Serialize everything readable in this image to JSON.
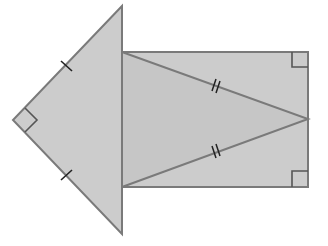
{
  "diagram": {
    "colors": {
      "fill": "#cccccc",
      "fill_inner": "#c6c6c6",
      "stroke": "#7a7a7a",
      "mark": "#222222",
      "background": "#ffffff"
    },
    "shapes": {
      "left_triangle": {
        "type": "right-isosceles-triangle",
        "vertices": [
          [
            122,
            6
          ],
          [
            13,
            120
          ],
          [
            122,
            234
          ]
        ],
        "right_angle_at": "left-apex",
        "equal_sides_mark": "single-tick"
      },
      "rectangle": {
        "type": "rectangle",
        "x": 122,
        "y": 52,
        "width": 186,
        "height": 135,
        "right_angles_marked": [
          "top-right",
          "bottom-right"
        ]
      },
      "inner_triangle": {
        "type": "isosceles-triangle",
        "vertices": [
          [
            122,
            52
          ],
          [
            308,
            119
          ],
          [
            122,
            187
          ]
        ],
        "equal_sides_mark": "double-tick"
      }
    }
  }
}
